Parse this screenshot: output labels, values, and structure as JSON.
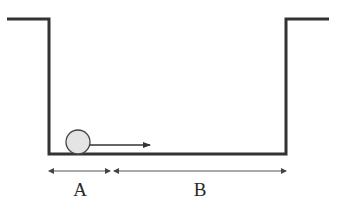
{
  "diagram": {
    "type": "physics-trough",
    "colors": {
      "stroke": "#333333",
      "ball_fill": "#e4e4e4",
      "ball_stroke": "#444444",
      "background": "#ffffff"
    },
    "ball": {
      "cx": 78,
      "cy": 142,
      "r": 12
    },
    "velocity_arrow": {
      "x1": 90,
      "y1": 145,
      "x2": 150,
      "y2": 145
    },
    "segments": [
      {
        "label": "A",
        "x1": 49,
        "x2": 110,
        "y": 171,
        "label_x": 80,
        "label_y": 196
      },
      {
        "label": "B",
        "x1": 114,
        "x2": 286,
        "y": 171,
        "label_x": 200,
        "label_y": 196
      }
    ]
  }
}
